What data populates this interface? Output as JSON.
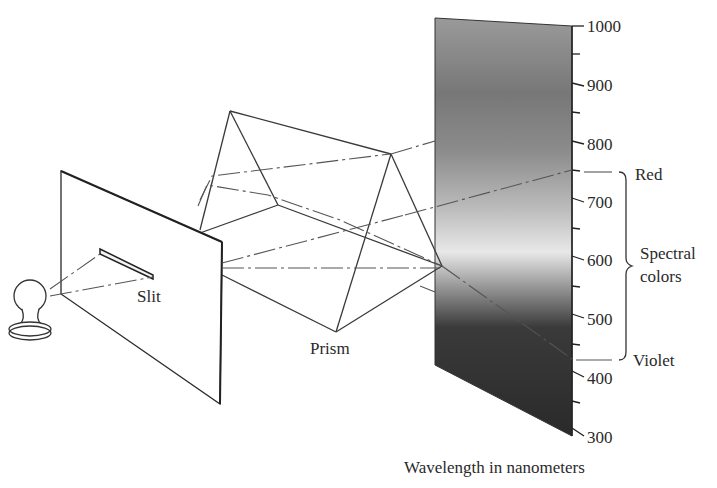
{
  "figure": {
    "labels": {
      "slit": "Slit",
      "prism": "Prism",
      "red": "Red",
      "violet": "Violet",
      "spectral_line1": "Spectral",
      "spectral_line2": "colors",
      "axis_title": "Wavelength in nanometers"
    },
    "axis": {
      "ticks": [
        {
          "value": "1000",
          "y": 26
        },
        {
          "value": "900",
          "y": 83
        },
        {
          "value": "800",
          "y": 143
        },
        {
          "value": "700",
          "y": 201
        },
        {
          "value": "600",
          "y": 259
        },
        {
          "value": "500",
          "y": 318
        },
        {
          "value": "400",
          "y": 377
        },
        {
          "value": "300",
          "y": 436
        }
      ],
      "range": [
        300,
        1000
      ],
      "unit": "nanometers"
    },
    "spectral_range": {
      "red_nm": 750,
      "violet_nm": 425
    },
    "colors": {
      "line": "#3a3a3a",
      "spectrum_light": "#e6e6e6",
      "spectrum_mid": "#8a8a8a",
      "spectrum_dark": "#2b2b2b"
    }
  }
}
